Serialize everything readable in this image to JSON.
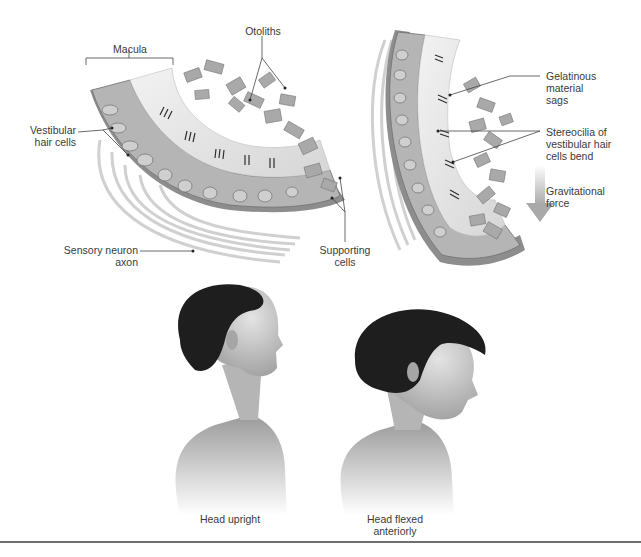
{
  "figure": {
    "panels": {
      "macula_upright": {
        "labels": {
          "macula": "Macula",
          "otoliths": "Otoliths",
          "vestibular_hair_cells": [
            "Vestibular",
            "hair cells"
          ],
          "sensory_neuron_axon": [
            "Sensory neuron",
            "axon"
          ],
          "supporting_cells": [
            "Supporting",
            "cells"
          ]
        }
      },
      "macula_tilted": {
        "labels": {
          "gelatinous": [
            "Gelatinous",
            "material",
            "sags"
          ],
          "stereocilia": [
            "Stereocilia of",
            "vestibular hair",
            "cells bend"
          ],
          "gravitational": [
            "Gravitational",
            "force"
          ]
        }
      },
      "heads": {
        "upright_caption": "Head upright",
        "flexed_caption": [
          "Head flexed",
          "anteriorly"
        ]
      }
    },
    "colors": {
      "tissue": "#b9b9b9",
      "tissue_dark": "#7a7a7a",
      "otolith": "#a8a8a8",
      "hair": "#1e1e1e",
      "skin": "#c9c9c9",
      "shirt": "#8a8a8a",
      "arrow": "#bdbdbd",
      "rule": "#6f6f6f"
    }
  }
}
